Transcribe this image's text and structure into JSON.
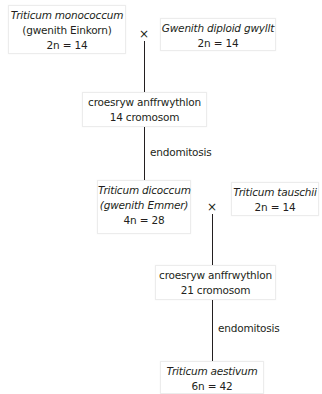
{
  "diagram": {
    "nodes": {
      "monococcum": {
        "species": "Triticum monococcum",
        "common": "(gwenith Einkorn)",
        "ploidy": "2n = 14"
      },
      "wild_diploid": {
        "species": "Gwenith diploid gwyllt",
        "ploidy": "2n = 14"
      },
      "hybrid1": {
        "line1": "croesryw anffrwythlon",
        "line2": "14 cromosom"
      },
      "dicoccum": {
        "species": "Triticum dicoccum",
        "common": "(gwenith Emmer)",
        "ploidy": "4n = 28"
      },
      "tauschii": {
        "species": "Triticum tauschii",
        "ploidy": "2n = 14"
      },
      "hybrid2": {
        "line1": "croesryw anffrwythlon",
        "line2": "21 cromosom"
      },
      "aestivum": {
        "species": "Triticum aestivum",
        "ploidy": "6n = 42"
      }
    },
    "cross_symbol": "×",
    "process_labels": {
      "endomitosis1": "endomitosis",
      "endomitosis2": "endomitosis"
    }
  }
}
